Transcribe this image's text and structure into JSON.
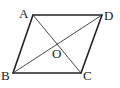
{
  "diagram": {
    "type": "parallelogram",
    "vertices": {
      "A": {
        "label": "A",
        "x": 33,
        "y": 15
      },
      "B": {
        "label": "B",
        "x": 13,
        "y": 73
      },
      "C": {
        "label": "C",
        "x": 81,
        "y": 73
      },
      "D": {
        "label": "D",
        "x": 102,
        "y": 15
      }
    },
    "center": {
      "label": "O",
      "x": 57,
      "y": 44
    },
    "sides": [
      "AB",
      "BC",
      "CD",
      "DA"
    ],
    "diagonals": [
      "AC",
      "BD"
    ],
    "labels": {
      "A": "A",
      "B": "B",
      "C": "C",
      "D": "D",
      "O": "O"
    },
    "colors": {
      "line": "#222222",
      "background": "#ffffff"
    }
  }
}
